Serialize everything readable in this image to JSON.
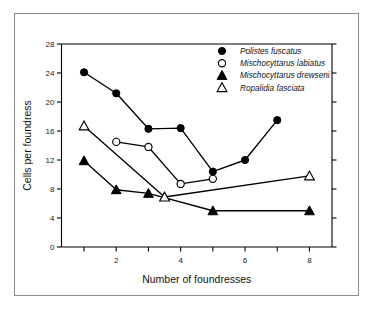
{
  "chart_data": {
    "type": "line",
    "title": "",
    "xlabel": "Number of foundresses",
    "ylabel": "Cells per foundress",
    "xlim": [
      0.3,
      8.7
    ],
    "ylim": [
      0,
      28
    ],
    "x_ticks": [
      1,
      2,
      3,
      4,
      5,
      6,
      7,
      8
    ],
    "x_tick_labels": [
      "",
      "2",
      "",
      "4",
      "",
      "6",
      "",
      "8"
    ],
    "y_ticks": [
      0,
      4,
      8,
      12,
      16,
      20,
      24,
      28
    ],
    "y_tick_labels": [
      "0",
      "4",
      "8",
      "12",
      "16",
      "20",
      "24",
      "28"
    ],
    "grid": false,
    "legend_position": "top-right",
    "series": [
      {
        "name": "Polistes fuscatus",
        "marker": "filled-circle",
        "x": [
          1,
          2,
          3,
          4,
          5,
          6,
          7
        ],
        "values": [
          24.1,
          21.2,
          16.3,
          16.4,
          10.4,
          12.0,
          17.5
        ]
      },
      {
        "name": "Mischocyttarus labiatus",
        "marker": "open-circle",
        "x": [
          2,
          3,
          4,
          5
        ],
        "values": [
          14.5,
          13.8,
          8.7,
          9.4
        ]
      },
      {
        "name": "Mischocyttarus drewseni",
        "marker": "filled-triangle",
        "x": [
          1,
          2,
          3,
          5,
          8
        ],
        "values": [
          11.9,
          7.9,
          7.4,
          5.0,
          5.0
        ]
      },
      {
        "name": "Ropalidia fasciata",
        "marker": "open-triangle",
        "x": [
          1,
          3.5,
          8
        ],
        "values": [
          16.7,
          6.9,
          9.8
        ]
      }
    ]
  },
  "legend": {
    "entries": [
      {
        "marker": "filled-circle",
        "label": "Polistes fuscatus"
      },
      {
        "marker": "open-circle",
        "label": "Mischocyttarus labiatus"
      },
      {
        "marker": "filled-triangle",
        "label": "Mischocyttarus drewseni"
      },
      {
        "marker": "open-triangle",
        "label": "Ropalidia fasciata"
      }
    ]
  }
}
